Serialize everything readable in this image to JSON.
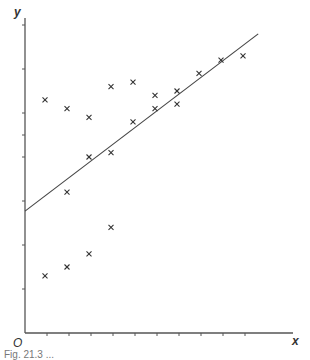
{
  "chart_data": {
    "type": "scatter",
    "title": "",
    "xlabel": "x",
    "ylabel": "y",
    "origin_label": "O",
    "xlim": [
      0,
      12
    ],
    "ylim": [
      0,
      7
    ],
    "x_ticks": [
      1,
      2,
      3,
      4,
      5,
      6,
      7,
      8,
      9,
      10
    ],
    "y_ticks": [
      1,
      2,
      3,
      4,
      4.5,
      5,
      6,
      7
    ],
    "tick_labels_shown": false,
    "grid": false,
    "marker": "x",
    "series": [
      {
        "name": "observations",
        "points": [
          {
            "x": 1,
            "y": 5.3
          },
          {
            "x": 1,
            "y": 1.3
          },
          {
            "x": 2,
            "y": 5.1
          },
          {
            "x": 2,
            "y": 3.2
          },
          {
            "x": 2,
            "y": 1.5
          },
          {
            "x": 3,
            "y": 4.0
          },
          {
            "x": 3,
            "y": 4.9
          },
          {
            "x": 3,
            "y": 1.8
          },
          {
            "x": 4,
            "y": 5.6
          },
          {
            "x": 4,
            "y": 4.1
          },
          {
            "x": 4,
            "y": 2.4
          },
          {
            "x": 5,
            "y": 4.8
          },
          {
            "x": 5,
            "y": 5.7
          },
          {
            "x": 6,
            "y": 5.4
          },
          {
            "x": 6,
            "y": 5.1
          },
          {
            "x": 7,
            "y": 5.5
          },
          {
            "x": 7,
            "y": 5.2
          },
          {
            "x": 8,
            "y": 5.9
          },
          {
            "x": 9,
            "y": 6.2
          },
          {
            "x": 10,
            "y": 6.3
          }
        ]
      }
    ],
    "fit_line": {
      "name": "regression line",
      "intercept": 2.77,
      "slope": 0.38,
      "x_range": [
        0,
        10.6
      ]
    }
  },
  "caption": "Fig. 21.3 ..."
}
